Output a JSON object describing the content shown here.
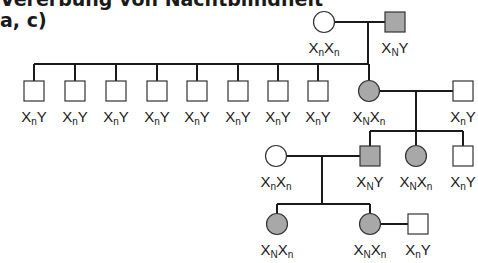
{
  "title": {
    "line1": "Vererbung von Nachtblindheit",
    "line2": "a, c)"
  },
  "colors": {
    "affected": "#a8a8a8",
    "unaffected": "#ffffff",
    "line": "#1a1a1a"
  },
  "individuals": [
    {
      "id": "g1f",
      "sex": "female",
      "affected": false,
      "cx": 324,
      "cy": 22,
      "genotype": [
        "X",
        "n",
        "X",
        "n"
      ],
      "label_x": 324,
      "label_y": 40
    },
    {
      "id": "g1m",
      "sex": "male",
      "affected": true,
      "cx": 395,
      "cy": 22,
      "genotype": [
        "X",
        "N",
        "Y",
        ""
      ],
      "label_x": 395,
      "label_y": 40
    },
    {
      "id": "g2s1",
      "sex": "male",
      "affected": false,
      "cx": 34,
      "cy": 91,
      "genotype": [
        "X",
        "n",
        "Y",
        ""
      ],
      "label_x": 34,
      "label_y": 109
    },
    {
      "id": "g2s2",
      "sex": "male",
      "affected": false,
      "cx": 75,
      "cy": 91,
      "genotype": [
        "X",
        "n",
        "Y",
        ""
      ],
      "label_x": 75,
      "label_y": 109
    },
    {
      "id": "g2s3",
      "sex": "male",
      "affected": false,
      "cx": 116,
      "cy": 91,
      "genotype": [
        "X",
        "n",
        "Y",
        ""
      ],
      "label_x": 116,
      "label_y": 109
    },
    {
      "id": "g2s4",
      "sex": "male",
      "affected": false,
      "cx": 157,
      "cy": 91,
      "genotype": [
        "X",
        "n",
        "Y",
        ""
      ],
      "label_x": 157,
      "label_y": 109
    },
    {
      "id": "g2s5",
      "sex": "male",
      "affected": false,
      "cx": 197,
      "cy": 91,
      "genotype": [
        "X",
        "n",
        "Y",
        ""
      ],
      "label_x": 197,
      "label_y": 109
    },
    {
      "id": "g2s6",
      "sex": "male",
      "affected": false,
      "cx": 238,
      "cy": 91,
      "genotype": [
        "X",
        "n",
        "Y",
        ""
      ],
      "label_x": 238,
      "label_y": 109
    },
    {
      "id": "g2s7",
      "sex": "male",
      "affected": false,
      "cx": 278,
      "cy": 91,
      "genotype": [
        "X",
        "n",
        "Y",
        ""
      ],
      "label_x": 278,
      "label_y": 109
    },
    {
      "id": "g2s8",
      "sex": "male",
      "affected": false,
      "cx": 318,
      "cy": 91,
      "genotype": [
        "X",
        "n",
        "Y",
        ""
      ],
      "label_x": 318,
      "label_y": 109
    },
    {
      "id": "g2d",
      "sex": "female",
      "affected": true,
      "cx": 369,
      "cy": 91,
      "genotype": [
        "X",
        "N",
        "X",
        "n"
      ],
      "label_x": 369,
      "label_y": 109
    },
    {
      "id": "g2h",
      "sex": "male",
      "affected": false,
      "cx": 463,
      "cy": 91,
      "genotype": [
        "X",
        "n",
        "Y",
        ""
      ],
      "label_x": 463,
      "label_y": 109
    },
    {
      "id": "g3w",
      "sex": "female",
      "affected": false,
      "cx": 276,
      "cy": 156,
      "genotype": [
        "X",
        "n",
        "X",
        "n"
      ],
      "label_x": 276,
      "label_y": 174
    },
    {
      "id": "g3m",
      "sex": "male",
      "affected": true,
      "cx": 370,
      "cy": 156,
      "genotype": [
        "X",
        "N",
        "Y",
        ""
      ],
      "label_x": 370,
      "label_y": 174
    },
    {
      "id": "g3f",
      "sex": "female",
      "affected": true,
      "cx": 416,
      "cy": 156,
      "genotype": [
        "X",
        "N",
        "X",
        "n"
      ],
      "label_x": 416,
      "label_y": 174
    },
    {
      "id": "g3s",
      "sex": "male",
      "affected": false,
      "cx": 463,
      "cy": 156,
      "genotype": [
        "X",
        "n",
        "Y",
        ""
      ],
      "label_x": 463,
      "label_y": 174
    },
    {
      "id": "g4f1",
      "sex": "female",
      "affected": true,
      "cx": 277,
      "cy": 224,
      "genotype": [
        "X",
        "N",
        "X",
        "n"
      ],
      "label_x": 277,
      "label_y": 242
    },
    {
      "id": "g4f2",
      "sex": "female",
      "affected": true,
      "cx": 370,
      "cy": 224,
      "genotype": [
        "X",
        "N",
        "X",
        "n"
      ],
      "label_x": 370,
      "label_y": 242
    },
    {
      "id": "g4m",
      "sex": "male",
      "affected": false,
      "cx": 418,
      "cy": 224,
      "genotype": [
        "X",
        "n",
        "Y",
        ""
      ],
      "label_x": 418,
      "label_y": 242
    }
  ],
  "lines": [
    [
      335,
      22,
      385,
      22
    ],
    [
      368,
      22,
      368,
      64
    ],
    [
      34,
      64,
      368,
      64
    ],
    [
      34,
      64,
      34,
      81
    ],
    [
      75,
      64,
      75,
      81
    ],
    [
      116,
      64,
      116,
      81
    ],
    [
      157,
      64,
      157,
      81
    ],
    [
      197,
      64,
      197,
      81
    ],
    [
      238,
      64,
      238,
      81
    ],
    [
      278,
      64,
      278,
      81
    ],
    [
      318,
      64,
      318,
      81
    ],
    [
      369,
      64,
      369,
      80
    ],
    [
      380,
      91,
      453,
      91
    ],
    [
      416,
      91,
      416,
      131
    ],
    [
      370,
      131,
      463,
      131
    ],
    [
      370,
      131,
      370,
      146
    ],
    [
      416,
      131,
      416,
      145
    ],
    [
      463,
      131,
      463,
      146
    ],
    [
      287,
      156,
      360,
      156
    ],
    [
      322,
      156,
      322,
      204
    ],
    [
      277,
      204,
      370,
      204
    ],
    [
      277,
      204,
      277,
      213
    ],
    [
      370,
      204,
      370,
      213
    ],
    [
      381,
      224,
      408,
      224
    ]
  ]
}
